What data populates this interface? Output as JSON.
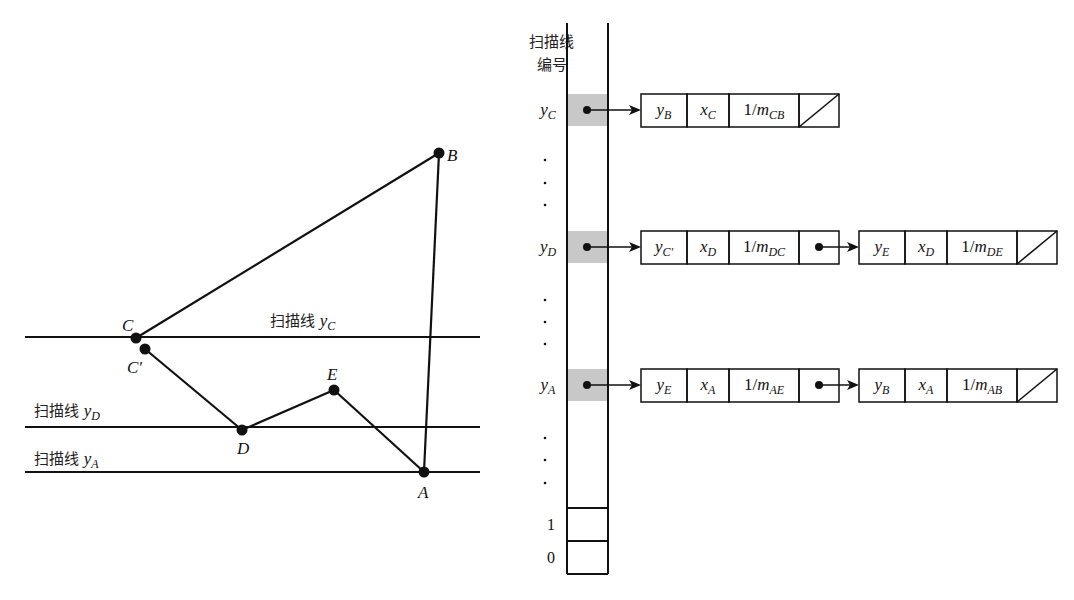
{
  "polygon": {
    "vertices": [
      {
        "id": "B",
        "label": "B",
        "x": 439,
        "y": 153
      },
      {
        "id": "C",
        "label": "C",
        "x": 136,
        "y": 338
      },
      {
        "id": "Cp",
        "label": "C′",
        "x": 145,
        "y": 349
      },
      {
        "id": "D",
        "label": "D",
        "x": 242,
        "y": 430
      },
      {
        "id": "E",
        "label": "E",
        "x": 334,
        "y": 390
      },
      {
        "id": "A",
        "label": "A",
        "x": 424,
        "y": 472
      }
    ],
    "edges": [
      [
        "C",
        "B"
      ],
      [
        "B",
        "A"
      ],
      [
        "A",
        "E"
      ],
      [
        "E",
        "D"
      ],
      [
        "D",
        "Cp"
      ]
    ]
  },
  "scanlines": [
    {
      "id": "yC",
      "prefix": "扫描线",
      "var": "y",
      "sub": "C",
      "y": 337,
      "label_x": 270,
      "label_y": 326
    },
    {
      "id": "yD",
      "prefix": "扫描线",
      "var": "y",
      "sub": "D",
      "y": 427,
      "label_x": 34,
      "label_y": 416
    },
    {
      "id": "yA",
      "prefix": "扫描线",
      "var": "y",
      "sub": "A",
      "y": 472,
      "label_x": 34,
      "label_y": 464
    }
  ],
  "table": {
    "header_line1": "扫描线",
    "header_line2": "编号",
    "rows": [
      {
        "var": "y",
        "sub": "C",
        "y": 110
      },
      {
        "var": "y",
        "sub": "D",
        "y": 247
      },
      {
        "var": "y",
        "sub": "A",
        "y": 385
      }
    ],
    "bottom_labels": [
      "1",
      "0"
    ]
  },
  "edge_lists": [
    {
      "row": "yC",
      "nodes": [
        {
          "cells": [
            {
              "v": "y",
              "s": "B"
            },
            {
              "v": "x",
              "s": "C"
            },
            {
              "v": "1/m",
              "s": "CB"
            }
          ],
          "terminal": true
        }
      ]
    },
    {
      "row": "yD",
      "nodes": [
        {
          "cells": [
            {
              "v": "y",
              "s": "C′"
            },
            {
              "v": "x",
              "s": "D"
            },
            {
              "v": "1/m",
              "s": "DC"
            }
          ],
          "terminal": false
        },
        {
          "cells": [
            {
              "v": "y",
              "s": "E"
            },
            {
              "v": "x",
              "s": "D"
            },
            {
              "v": "1/m",
              "s": "DE"
            }
          ],
          "terminal": true
        }
      ]
    },
    {
      "row": "yA",
      "nodes": [
        {
          "cells": [
            {
              "v": "y",
              "s": "E"
            },
            {
              "v": "x",
              "s": "A"
            },
            {
              "v": "1/m",
              "s": "AE"
            }
          ],
          "terminal": false
        },
        {
          "cells": [
            {
              "v": "y",
              "s": "B"
            },
            {
              "v": "x",
              "s": "A"
            },
            {
              "v": "1/m",
              "s": "AB"
            }
          ],
          "terminal": true
        }
      ]
    }
  ],
  "colors": {
    "line": "#111111",
    "highlight": "#c8c8c8"
  }
}
